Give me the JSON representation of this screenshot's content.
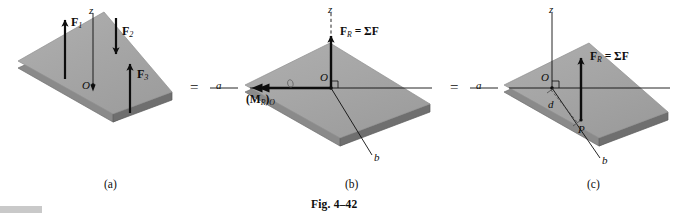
{
  "figure": {
    "caption": "Fig. 4–42",
    "source_kind": "engineering-mechanics-diagram",
    "background_color": "#ffffff",
    "plate_face_color": "#a8a8a8",
    "plate_edge_color": "#8d8d8d",
    "plate_side_color": "#777777",
    "ink_color": "#0d0d0d"
  },
  "equals": {
    "first": "=",
    "second": "="
  },
  "panels": [
    {
      "id": "a",
      "caption": "(a)",
      "origin_label": "O",
      "z_axis_label": "z",
      "z_axis_style": "solid",
      "forces": [
        {
          "name": "F1",
          "label_base": "F",
          "label_sub": "1",
          "direction": "up"
        },
        {
          "name": "F2",
          "label_base": "F",
          "label_sub": "2",
          "direction": "down"
        },
        {
          "name": "F3",
          "label_base": "F",
          "label_sub": "3",
          "direction": "up"
        }
      ]
    },
    {
      "id": "b",
      "caption": "(b)",
      "origin_label": "O",
      "z_axis_label": "z",
      "z_axis_style": "dashed",
      "axis_a_label": "a",
      "axis_b_label": "b",
      "resultant_label_base": "F",
      "resultant_label_sub": "R",
      "resultant_label_rest": " = ΣF",
      "moment_label_open": "(",
      "moment_label_base": "M",
      "moment_label_sub": "R",
      "moment_label_close": ")",
      "moment_label_sub2": "O",
      "has_right_angle_mark": true
    },
    {
      "id": "c",
      "caption": "(c)",
      "origin_label": "O",
      "z_axis_label": "z",
      "z_axis_style": "solid",
      "axis_a_label": "a",
      "axis_b_label": "b",
      "point_label": "P",
      "distance_label": "d",
      "resultant_label_base": "F",
      "resultant_label_sub": "R",
      "resultant_label_rest": " = ΣF",
      "has_right_angle_mark": true
    }
  ]
}
